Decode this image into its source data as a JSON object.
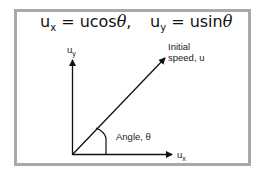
{
  "equations": {
    "ux": {
      "symbol": "u",
      "subscript": "x",
      "expr": " = ucos",
      "theta": "θ",
      "tail": ","
    },
    "uy": {
      "symbol": "u",
      "subscript": "y",
      "expr": " = usin",
      "theta": "θ"
    }
  },
  "labels": {
    "y_axis": {
      "symbol": "u",
      "subscript": "y"
    },
    "x_axis": {
      "symbol": "u",
      "subscript": "x"
    },
    "velocity_line1": "Initial",
    "velocity_line2": "speed, u",
    "angle": "Angle, θ"
  },
  "colors": {
    "frame_border": "#a9a9a9",
    "lines": "#111111",
    "background": "#ffffff"
  }
}
